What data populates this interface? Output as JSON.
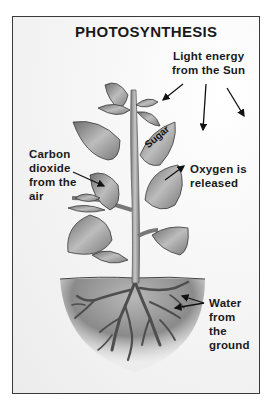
{
  "diagram": {
    "title": "PHOTOSYNTHESIS",
    "labels": {
      "light_energy": "Light energy\nfrom the Sun",
      "carbon_dioxide": "Carbon\ndioxide\nfrom the\nair",
      "oxygen": "Oxygen is\nreleased",
      "water": "Water\nfrom\nthe\nground",
      "sugar": "Sugar"
    },
    "arrows": [
      {
        "from": "light_energy",
        "to": "sugar-leaf"
      },
      {
        "from": "light_energy",
        "to": "down"
      },
      {
        "from": "light_energy",
        "to": "down-right"
      },
      {
        "from": "carbon_dioxide",
        "to": "left-leaf"
      },
      {
        "from": "right-leaf",
        "to": "oxygen"
      },
      {
        "from": "water",
        "to": "roots"
      }
    ],
    "colors": {
      "frame": "#3a3a3a",
      "leaf_fill": "#9a9a9a",
      "stem": "#888888",
      "soil": "#8c8c8c",
      "roots": "#5a5a5a",
      "text": "#1a1a1a"
    }
  }
}
